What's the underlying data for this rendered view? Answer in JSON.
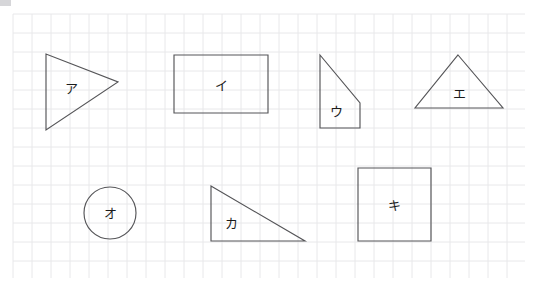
{
  "page": {
    "background_color": "#ffffff",
    "width": 548,
    "height": 291
  },
  "grid": {
    "name": "graph-paper-grid",
    "line_color": "#e8e8ea",
    "major_line_color": "#dedee2",
    "cell_size_px": 19,
    "origin_x": 13,
    "origin_y": 14,
    "extent_x": 525,
    "extent_y": 278,
    "visible": true
  },
  "artifact": {
    "name": "corner-smudge",
    "color": "#cfcfd2",
    "label": ""
  },
  "shapes": [
    {
      "id": "shape-a",
      "label": "ア",
      "type": "triangle",
      "description": "right-pointing triangle",
      "stroke": "#555558",
      "points": "46,54 46,130 118,82",
      "label_x": 71,
      "label_y": 89
    },
    {
      "id": "shape-i",
      "label": "イ",
      "type": "rectangle",
      "description": "horizontal rectangle",
      "stroke": "#555558",
      "points": "174,55 268,55 268,113 174,113",
      "label_x": 221,
      "label_y": 86
    },
    {
      "id": "shape-u",
      "label": "ウ",
      "type": "quadrilateral",
      "description": "right trapezoid with diagonal top edge",
      "stroke": "#555558",
      "points": "320,55 360,103 360,128 320,128",
      "label_x": 336,
      "label_y": 112
    },
    {
      "id": "shape-e",
      "label": "エ",
      "type": "triangle",
      "description": "isosceles triangle pointing up",
      "stroke": "#555558",
      "points": "458,55 503,108 415,108",
      "label_x": 459,
      "label_y": 94
    },
    {
      "id": "shape-o",
      "label": "オ",
      "type": "circle",
      "description": "circle",
      "stroke": "#555558",
      "cx": 110,
      "cy": 213,
      "r": 26,
      "label_x": 110,
      "label_y": 214
    },
    {
      "id": "shape-ka",
      "label": "カ",
      "type": "triangle",
      "description": "right triangle, right angle at bottom-left",
      "stroke": "#555558",
      "points": "211,186 211,241 305,241",
      "label_x": 231,
      "label_y": 224
    },
    {
      "id": "shape-ki",
      "label": "キ",
      "type": "square",
      "description": "square",
      "stroke": "#555558",
      "points": "358,168 431,168 431,241 358,241",
      "label_x": 394,
      "label_y": 206
    }
  ]
}
